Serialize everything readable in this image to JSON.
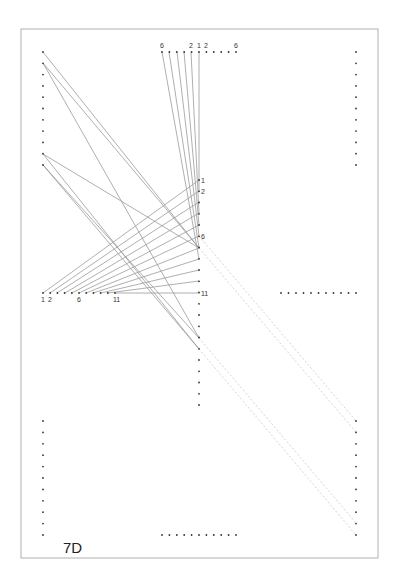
{
  "diagram": {
    "title": "7D",
    "frame": {
      "x": 21,
      "y": 29,
      "width": 357,
      "height": 529,
      "stroke": "#b0b0b0"
    },
    "colors": {
      "dot": "#333333",
      "solid_line": "#9a9a9a",
      "dashed_line": "#c8c8c8"
    },
    "dot_rows": [
      {
        "name": "left-top-column",
        "orientation": "vertical",
        "x": 43,
        "y_start": 52,
        "step": 11.3,
        "count": 11
      },
      {
        "name": "right-top-column",
        "orientation": "vertical",
        "x": 356,
        "y_start": 52,
        "step": 11.3,
        "count": 11
      },
      {
        "name": "top-row",
        "orientation": "horizontal",
        "y": 52,
        "x_start": 162,
        "step": 7.4,
        "count": 11
      },
      {
        "name": "middle-column",
        "orientation": "vertical",
        "x": 199,
        "y_start": 180,
        "step": 11.25,
        "count": 21
      },
      {
        "name": "left-middle-row",
        "orientation": "horizontal",
        "y": 293,
        "x_start": 43,
        "step": 7.2,
        "count": 11
      },
      {
        "name": "right-middle-row",
        "orientation": "horizontal",
        "y": 293,
        "x_start": 281,
        "step": 7.5,
        "count": 11
      },
      {
        "name": "left-bottom-column",
        "orientation": "vertical",
        "x": 43,
        "y_start": 421,
        "step": 11.4,
        "count": 11
      },
      {
        "name": "right-bottom-column",
        "orientation": "vertical",
        "x": 356,
        "y_start": 421,
        "step": 11.4,
        "count": 11
      },
      {
        "name": "bottom-row",
        "orientation": "horizontal",
        "y": 535,
        "x_start": 162,
        "step": 7.4,
        "count": 11
      }
    ],
    "labels": [
      {
        "text": "6",
        "x": 160,
        "y": 48
      },
      {
        "text": "2",
        "x": 189,
        "y": 48
      },
      {
        "text": "1",
        "x": 197,
        "y": 48
      },
      {
        "text": "2",
        "x": 204,
        "y": 48
      },
      {
        "text": "6",
        "x": 234,
        "y": 48
      },
      {
        "text": "1",
        "x": 201,
        "y": 183
      },
      {
        "text": "2",
        "x": 201,
        "y": 194
      },
      {
        "text": "6",
        "x": 201,
        "y": 239
      },
      {
        "text": "11",
        "x": 201,
        "y": 296
      },
      {
        "text": "1",
        "x": 41,
        "y": 302
      },
      {
        "text": "2",
        "x": 48,
        "y": 302
      },
      {
        "text": "6",
        "x": 77,
        "y": 302
      },
      {
        "text": "11",
        "x": 113,
        "y": 302
      }
    ],
    "solid_lines": [
      [
        162,
        52,
        199,
        259
      ],
      [
        169,
        52,
        199,
        248
      ],
      [
        177,
        52,
        199,
        236
      ],
      [
        184,
        52,
        199,
        225
      ],
      [
        191,
        52,
        199,
        213
      ],
      [
        199,
        52,
        199,
        191
      ],
      [
        43,
        293,
        199,
        180
      ],
      [
        50,
        293,
        199,
        191
      ],
      [
        57,
        293,
        199,
        202
      ],
      [
        65,
        293,
        199,
        213
      ],
      [
        72,
        293,
        199,
        225
      ],
      [
        79,
        293,
        199,
        236
      ],
      [
        86,
        293,
        199,
        248
      ],
      [
        93,
        293,
        199,
        259
      ],
      [
        101,
        293,
        199,
        270
      ],
      [
        108,
        293,
        199,
        281
      ],
      [
        115,
        293,
        199,
        293
      ],
      [
        43,
        52,
        199,
        248
      ],
      [
        43,
        63,
        199,
        248
      ],
      [
        43,
        63,
        199,
        338
      ],
      [
        43,
        154,
        199,
        248
      ],
      [
        43,
        154,
        199,
        349
      ],
      [
        43,
        165,
        199,
        338
      ],
      [
        43,
        165,
        199,
        349
      ]
    ],
    "dashed_lines": [
      [
        199,
        236,
        356,
        421
      ],
      [
        199,
        248,
        356,
        432
      ],
      [
        199,
        338,
        356,
        523
      ],
      [
        199,
        349,
        356,
        535
      ]
    ]
  }
}
